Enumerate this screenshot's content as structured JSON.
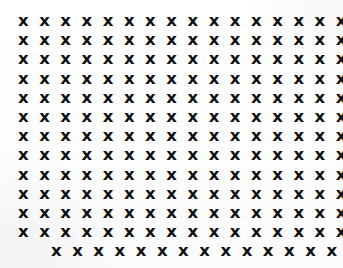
{
  "document": {
    "kind": "x-character-grid",
    "background_color": "#fefefe",
    "ink_color": "#101010",
    "columns_full_row": 23,
    "columns_last_row": 18,
    "row_count": 13,
    "full_row_count": 12,
    "last_row_indented": true,
    "character": "x",
    "rows": [
      "x x x x x x x x x x x x x x x x x x x x x x x",
      "x x x x x x x x x x x x x x x x x x x x x x x",
      "x x x x x x x x x x x x x x x x x x x x x x x",
      "x x x x x x x x x x x x x x x x x x x x x x x",
      "x x x x x x x x x x x x x x x x x x x x x x x",
      "x x x x x x x x x x x x x x x x x x x x x x x",
      "x x x x x x x x x x x x x x x x x x x x x x x",
      "x x x x x x x x x x x x x x x x x x x x x x x",
      "x x x x x x x x x x x x x x x x x x x x x x x",
      "x x x x x x x x x x x x x x x x x x x x x x x",
      "x x x x x x x x x x x x x x x x x x x x x x x",
      "x x x x x x x x x x x x x x x x x x x x x x x",
      "x x x x x x x x x x x x x x x x x x"
    ]
  }
}
